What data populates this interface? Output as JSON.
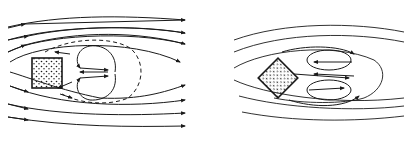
{
  "figure": {
    "type": "flow-around-obstacle-diagram",
    "stroke_color": "#1a1a1a",
    "background": "#ffffff",
    "panels": [
      {
        "id": "left",
        "obstacle": "square",
        "obstacle_orientation": "axis-aligned",
        "obstacle_fill": "stippled",
        "streamlines": "horizontal flow left to right with arrows",
        "wake": "two counter-rotating vortices bounded by dashed separation line"
      },
      {
        "id": "right",
        "obstacle": "square",
        "obstacle_orientation": "rotated 45 degrees",
        "obstacle_fill": "stippled",
        "streamlines": "horizontal flow without arrows",
        "wake": "two counter-rotating elliptical vortices with arrows"
      }
    ]
  }
}
